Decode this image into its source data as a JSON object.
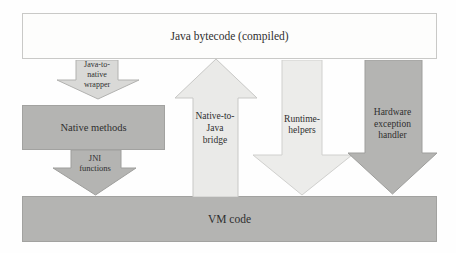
{
  "diagram": {
    "top_bar": {
      "label": "Java bytecode (compiled)"
    },
    "bottom_bar": {
      "label": "VM code"
    },
    "native_methods_box": {
      "label": "Native methods"
    },
    "arrows": {
      "wrapper": {
        "label": "Java-to-\nnative\nwrapper",
        "direction": "down",
        "fill": "#d9d9d7",
        "stroke": "#b2b2b0"
      },
      "jni": {
        "label": "JNI\nfunctions",
        "direction": "down",
        "fill": "#b4b4b2",
        "stroke": "#9e9e9c"
      },
      "bridge": {
        "label": "Native-to-\nJava\nbridge",
        "direction": "up",
        "fill": "#eaeae8",
        "stroke": "#c8c8c6"
      },
      "runtime": {
        "label": "Runtime-\nhelpers",
        "direction": "down",
        "fill": "#ececea",
        "stroke": "#d0d0ce"
      },
      "hardware": {
        "label": "Hardware\nexception\nhandler",
        "direction": "down",
        "fill": "#b4b4b2",
        "stroke": "#9e9e9c"
      }
    },
    "colors": {
      "top_bar_fill": "#fdfdfc",
      "top_bar_border": "#c9c9c7",
      "gray_fill": "#b4b4b2",
      "gray_border": "#a2a2a0",
      "text": "#2f2f2f",
      "background": "#fefefe"
    }
  }
}
